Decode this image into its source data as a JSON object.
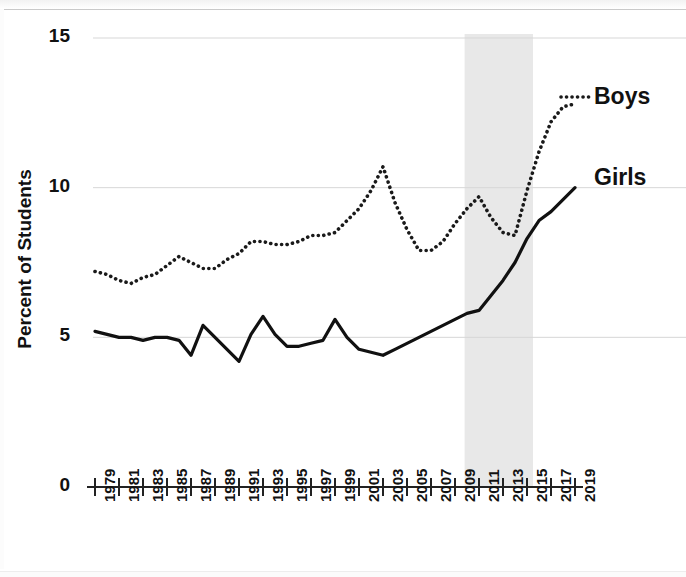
{
  "chart_data": {
    "type": "line",
    "title": "",
    "xlabel": "",
    "ylabel": "Percent of Students",
    "xlim": [
      1979,
      2019
    ],
    "ylim": [
      0,
      15
    ],
    "ytick_values": [
      0,
      5,
      10,
      15
    ],
    "ytick_labels": [
      "0",
      "5",
      "10",
      "15"
    ],
    "grid": "horizontal-light",
    "legend_position": "inline-right",
    "x": [
      1979,
      1980,
      1981,
      1982,
      1983,
      1984,
      1985,
      1986,
      1987,
      1988,
      1989,
      1990,
      1991,
      1992,
      1993,
      1994,
      1995,
      1996,
      1997,
      1998,
      1999,
      2000,
      2001,
      2002,
      2003,
      2004,
      2005,
      2006,
      2007,
      2008,
      2009,
      2010,
      2011,
      2012,
      2013,
      2014,
      2015,
      2016,
      2017,
      2018,
      2019
    ],
    "xtick_labels": [
      "1979",
      "1981",
      "1983",
      "1985",
      "1987",
      "1989",
      "1991",
      "1993",
      "1995",
      "1997",
      "1999",
      "2001",
      "2003",
      "2005",
      "2007",
      "2009",
      "2011",
      "2013",
      "2015",
      "2017",
      "2019"
    ],
    "series": [
      {
        "name": "Boys",
        "style": "dotted",
        "color": "#1a1a1a",
        "values": [
          7.2,
          7.1,
          6.9,
          6.8,
          7.0,
          7.1,
          7.4,
          7.7,
          7.5,
          7.3,
          7.3,
          7.6,
          7.8,
          8.2,
          8.2,
          8.1,
          8.1,
          8.2,
          8.4,
          8.4,
          8.5,
          8.9,
          9.3,
          9.9,
          10.7,
          9.5,
          8.6,
          7.9,
          7.9,
          8.2,
          8.8,
          9.3,
          9.7,
          9.0,
          8.5,
          8.4,
          9.9,
          11.2,
          12.2,
          12.7,
          12.8
        ]
      },
      {
        "name": "Girls",
        "style": "solid",
        "color": "#111111",
        "values": [
          5.2,
          5.1,
          5.0,
          5.0,
          4.9,
          5.0,
          5.0,
          4.9,
          4.4,
          5.4,
          5.0,
          4.6,
          4.2,
          5.1,
          5.7,
          5.1,
          4.7,
          4.7,
          4.8,
          4.9,
          5.6,
          5.0,
          4.6,
          4.5,
          4.4,
          4.6,
          4.8,
          5.0,
          5.2,
          5.4,
          5.6,
          5.8,
          5.9,
          6.4,
          6.9,
          7.5,
          8.3,
          8.9,
          9.2,
          9.6,
          10.0
        ]
      }
    ],
    "shaded_region": {
      "x_start": 2009.8,
      "x_end": 2015.5,
      "color": "#e8e8e8",
      "label": ""
    }
  },
  "labels": {
    "boys": "Boys",
    "girls": "Girls",
    "y_axis_title": "Percent of Students"
  }
}
